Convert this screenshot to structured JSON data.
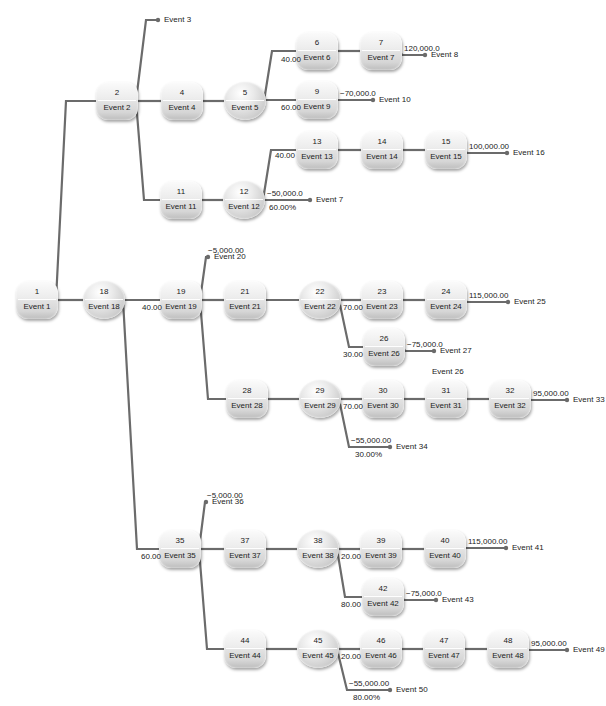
{
  "diagram": {
    "type": "decision-tree",
    "colors": {
      "line": "#6b6b6b",
      "node_light": "#f4f4f4",
      "node_dark": "#bdbdbd"
    },
    "nodes": [
      {
        "id": "1",
        "num": "1",
        "label": "Event 1",
        "shape": "square"
      },
      {
        "id": "2",
        "num": "2",
        "label": "Event 2",
        "shape": "square"
      },
      {
        "id": "4",
        "num": "4",
        "label": "Event 4",
        "shape": "square"
      },
      {
        "id": "5",
        "num": "5",
        "label": "Event 5",
        "shape": "circle"
      },
      {
        "id": "6",
        "num": "6",
        "label": "Event 6",
        "shape": "square"
      },
      {
        "id": "7",
        "num": "7",
        "label": "Event 7",
        "shape": "square"
      },
      {
        "id": "9",
        "num": "9",
        "label": "Event 9",
        "shape": "square"
      },
      {
        "id": "11",
        "num": "11",
        "label": "Event 11",
        "shape": "square"
      },
      {
        "id": "12",
        "num": "12",
        "label": "Event 12",
        "shape": "circle"
      },
      {
        "id": "13",
        "num": "13",
        "label": "Event 13",
        "shape": "square"
      },
      {
        "id": "14",
        "num": "14",
        "label": "Event 14",
        "shape": "square"
      },
      {
        "id": "15",
        "num": "15",
        "label": "Event 15",
        "shape": "square"
      },
      {
        "id": "18",
        "num": "18",
        "label": "Event 18",
        "shape": "circle"
      },
      {
        "id": "19",
        "num": "19",
        "label": "Event 19",
        "shape": "square"
      },
      {
        "id": "21",
        "num": "21",
        "label": "Event 21",
        "shape": "square"
      },
      {
        "id": "22",
        "num": "22",
        "label": "Event 22",
        "shape": "circle"
      },
      {
        "id": "23",
        "num": "23",
        "label": "Event 23",
        "shape": "square"
      },
      {
        "id": "24",
        "num": "24",
        "label": "Event 24",
        "shape": "square"
      },
      {
        "id": "26",
        "num": "26",
        "label": "Event 26",
        "shape": "square"
      },
      {
        "id": "28",
        "num": "28",
        "label": "Event 28",
        "shape": "square"
      },
      {
        "id": "29",
        "num": "29",
        "label": "Event 29",
        "shape": "circle"
      },
      {
        "id": "30",
        "num": "30",
        "label": "Event 30",
        "shape": "square"
      },
      {
        "id": "31",
        "num": "31",
        "label": "Event 31",
        "shape": "square"
      },
      {
        "id": "32",
        "num": "32",
        "label": "Event 32",
        "shape": "square"
      },
      {
        "id": "35",
        "num": "35",
        "label": "Event 35",
        "shape": "square"
      },
      {
        "id": "37",
        "num": "37",
        "label": "Event 37",
        "shape": "square"
      },
      {
        "id": "38",
        "num": "38",
        "label": "Event 38",
        "shape": "circle"
      },
      {
        "id": "39",
        "num": "39",
        "label": "Event 39",
        "shape": "square"
      },
      {
        "id": "40",
        "num": "40",
        "label": "Event 40",
        "shape": "square"
      },
      {
        "id": "42",
        "num": "42",
        "label": "Event 42",
        "shape": "square"
      },
      {
        "id": "44",
        "num": "44",
        "label": "Event 44",
        "shape": "square"
      },
      {
        "id": "45",
        "num": "45",
        "label": "Event 45",
        "shape": "circle"
      },
      {
        "id": "46",
        "num": "46",
        "label": "Event 46",
        "shape": "square"
      },
      {
        "id": "47",
        "num": "47",
        "label": "Event 47",
        "shape": "square"
      },
      {
        "id": "48",
        "num": "48",
        "label": "Event 48",
        "shape": "square"
      }
    ],
    "terminals": [
      {
        "id": "t3",
        "label": "Event 3",
        "value": ""
      },
      {
        "id": "t8",
        "label": "Event 8",
        "value": "120,000.0"
      },
      {
        "id": "t10",
        "label": "Event 10",
        "value": "−70,000.0"
      },
      {
        "id": "t16",
        "label": "Event 16",
        "value": "100,000.00"
      },
      {
        "id": "t7",
        "label": "Event 7",
        "value": "−50,000.0",
        "prob": "60.00%"
      },
      {
        "id": "t20",
        "label": "Event 20",
        "value": "−5,000.00"
      },
      {
        "id": "t25",
        "label": "Event 25",
        "value": "115,000.00"
      },
      {
        "id": "t27",
        "label": "Event 27",
        "value": "−75,000.0"
      },
      {
        "id": "t33",
        "label": "Event 33",
        "value": "95,000.00"
      },
      {
        "id": "t34",
        "label": "Event 34",
        "value": "−55,000.00",
        "prob": "30.00%"
      },
      {
        "id": "t36",
        "label": "Event 36",
        "value": "−5,000.00"
      },
      {
        "id": "t41",
        "label": "Event 41",
        "value": "115,000.00"
      },
      {
        "id": "t43",
        "label": "Event 43",
        "value": "−75,000.0"
      },
      {
        "id": "t49",
        "label": "Event 49",
        "value": "95,000.00"
      },
      {
        "id": "t50",
        "label": "Event 50",
        "value": "−55,000.00",
        "prob": "80.00%"
      }
    ],
    "branch_labels": [
      {
        "id": "b6",
        "text": "40.00"
      },
      {
        "id": "b9",
        "text": "60.00"
      },
      {
        "id": "b13",
        "text": "40.00"
      },
      {
        "id": "b19",
        "text": "40.00"
      },
      {
        "id": "b23",
        "text": "70.00"
      },
      {
        "id": "b26",
        "text": "30.00"
      },
      {
        "id": "b30",
        "text": "70.00"
      },
      {
        "id": "b35",
        "text": "60.00"
      },
      {
        "id": "b39",
        "text": "20.00"
      },
      {
        "id": "b42",
        "text": "80.00"
      },
      {
        "id": "b46",
        "text": "20.00"
      }
    ],
    "floating_labels": [
      {
        "id": "f26",
        "text": "Event 26"
      }
    ]
  }
}
